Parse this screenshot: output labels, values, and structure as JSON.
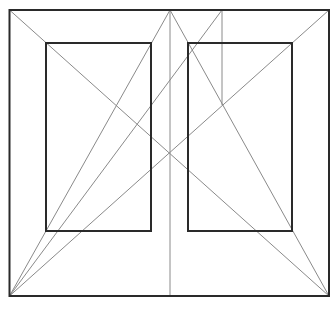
{
  "diagram": {
    "width": 335,
    "height": 311,
    "background": "#ffffff",
    "colors": {
      "frame": "#2a2a2a",
      "construction": "#8a8a8a"
    },
    "outer_frame": {
      "x": 9.5,
      "y": 10,
      "width": 319.5,
      "height": 286
    },
    "panels": [
      {
        "name": "left-panel",
        "x": 46,
        "y": 43,
        "width": 105,
        "height": 188
      },
      {
        "name": "right-panel",
        "x": 188,
        "y": 43,
        "width": 104,
        "height": 188
      }
    ],
    "construction_lines": [
      {
        "name": "diagonal-tl-br",
        "x1": 9.5,
        "y1": 10,
        "x2": 329,
        "y2": 296
      },
      {
        "name": "diagonal-tr-bl",
        "x1": 329,
        "y1": 10,
        "x2": 9.5,
        "y2": 296
      },
      {
        "name": "center-vertical",
        "x1": 170,
        "y1": 10,
        "x2": 170,
        "y2": 296
      },
      {
        "name": "apex-to-bottom-left",
        "x1": 170,
        "y1": 10,
        "x2": 9.5,
        "y2": 296
      },
      {
        "name": "apex-to-bottom-right",
        "x1": 170,
        "y1": 10,
        "x2": 329,
        "y2": 296
      },
      {
        "name": "secondary-vertical",
        "x1": 222,
        "y1": 10,
        "x2": 222,
        "y2": 105
      },
      {
        "name": "secondary-to-bottom-left",
        "x1": 222,
        "y1": 10,
        "x2": 9.5,
        "y2": 296
      }
    ]
  }
}
